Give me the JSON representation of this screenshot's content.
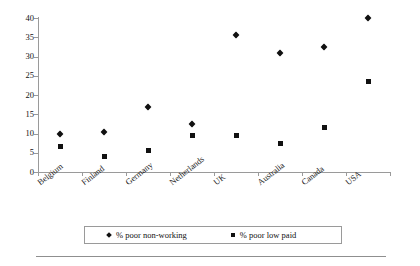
{
  "chart_data": {
    "type": "scatter",
    "title": "",
    "xlabel": "",
    "ylabel": "",
    "ylim": [
      0,
      40
    ],
    "ytick_step": 5,
    "grid": false,
    "legend_position": "bottom",
    "categories": [
      "Belgium",
      "Finland",
      "Germany",
      "Netherlands",
      "UK",
      "Australia",
      "Canada",
      "USA"
    ],
    "series": [
      {
        "name": "% poor non-working",
        "marker": "diamond",
        "color": "#111111",
        "values": [
          10,
          10.5,
          17,
          12.5,
          35.5,
          31,
          32.5,
          40
        ]
      },
      {
        "name": "% poor low paid",
        "marker": "square",
        "color": "#111111",
        "values": [
          6.5,
          4,
          5.5,
          9.5,
          9.5,
          7.5,
          11.5,
          23.5
        ]
      }
    ],
    "ytick_labels": [
      "0",
      "5",
      "10",
      "15",
      "20",
      "25",
      "30",
      "35",
      "40"
    ]
  },
  "legend": {
    "items": [
      {
        "label": "% poor non-working",
        "marker": "diamond"
      },
      {
        "label": "% poor low paid",
        "marker": "square"
      }
    ]
  },
  "colors": {
    "marker": "#111111",
    "axis": "#9a9a9a",
    "background": "#ffffff",
    "rule": "#8f8f8f"
  }
}
